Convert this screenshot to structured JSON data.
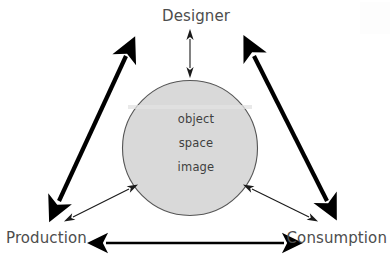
{
  "diagram": {
    "background_color": "#ffffff",
    "nodes": [
      {
        "id": "designer",
        "label": "Designer",
        "position": "top-center"
      },
      {
        "id": "production",
        "label": "Production",
        "position": "bottom-left"
      },
      {
        "id": "consumption",
        "label": "Consumption",
        "position": "bottom-right"
      }
    ],
    "center": {
      "shape": "circle",
      "fill_color": "#d9d9d9",
      "stroke_color": "#555555",
      "cx": 190,
      "cy": 148,
      "r": 68,
      "terms": [
        "object",
        "space",
        "image"
      ]
    },
    "connectors": [
      {
        "id": "designer-to-circle",
        "style": "thin",
        "heads": "double",
        "color": "#1a1a1a",
        "from": "designer",
        "to": "center"
      },
      {
        "id": "production-to-designer",
        "style": "thick",
        "heads": "double",
        "color": "#000000",
        "from": "production",
        "to": "designer"
      },
      {
        "id": "designer-to-consumption",
        "style": "thick",
        "heads": "double",
        "color": "#000000",
        "from": "designer",
        "to": "consumption"
      },
      {
        "id": "production-to-consumption",
        "style": "medium",
        "heads": "double",
        "color": "#000000",
        "from": "production",
        "to": "consumption"
      },
      {
        "id": "production-to-circle",
        "style": "thin",
        "heads": "double",
        "color": "#1a1a1a",
        "from": "production",
        "to": "center"
      },
      {
        "id": "circle-to-consumption",
        "style": "thin",
        "heads": "double",
        "color": "#1a1a1a",
        "from": "center",
        "to": "consumption"
      }
    ]
  }
}
